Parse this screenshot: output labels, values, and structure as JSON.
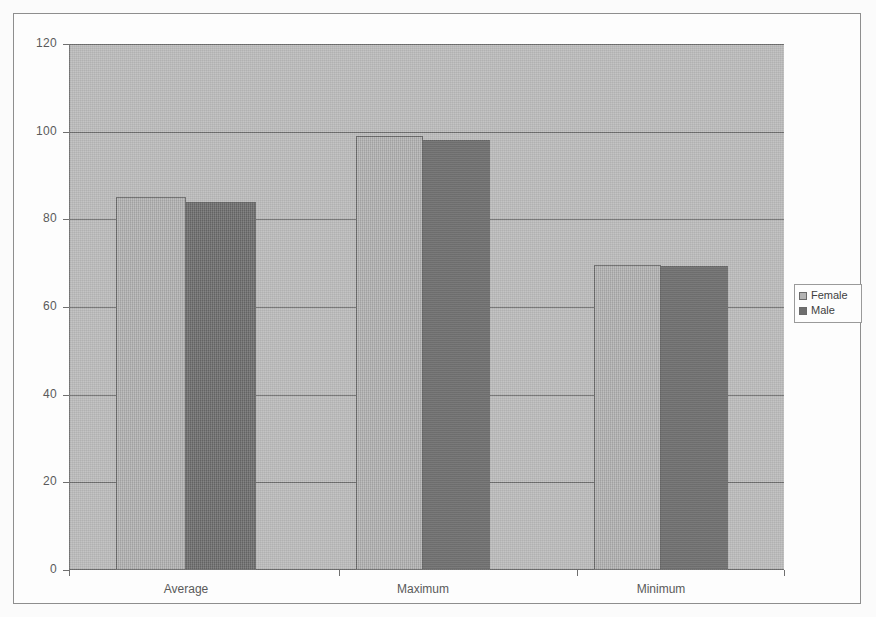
{
  "chart_data": {
    "type": "bar",
    "title": "",
    "xlabel": "",
    "ylabel": "",
    "categories": [
      "Average",
      "Maximum",
      "Minimum"
    ],
    "series": [
      {
        "name": "Female",
        "color": "#b3b3b3",
        "values": [
          85,
          99,
          69.5
        ]
      },
      {
        "name": "Male",
        "color": "#6e6e6e",
        "values": [
          84,
          98,
          69.3
        ]
      }
    ],
    "ylim": [
      0,
      120
    ],
    "ytick_labels": [
      "120",
      "100",
      "80",
      "60",
      "40",
      "20",
      "0"
    ],
    "ytick_values": [
      120,
      100,
      80,
      60,
      40,
      20,
      0
    ],
    "grid": true,
    "legend_position": "right",
    "legend_entries": [
      "Female",
      "Male"
    ],
    "plot_background": "#bdbdbd",
    "frame_background": "#fdfdfd"
  },
  "legend": {
    "items": [
      {
        "label": "Female"
      },
      {
        "label": "Male"
      }
    ]
  },
  "axis": {
    "y_labels": [
      "120",
      "100",
      "80",
      "60",
      "40",
      "20",
      "0"
    ],
    "x_labels": [
      "Average",
      "Maximum",
      "Minimum"
    ]
  }
}
